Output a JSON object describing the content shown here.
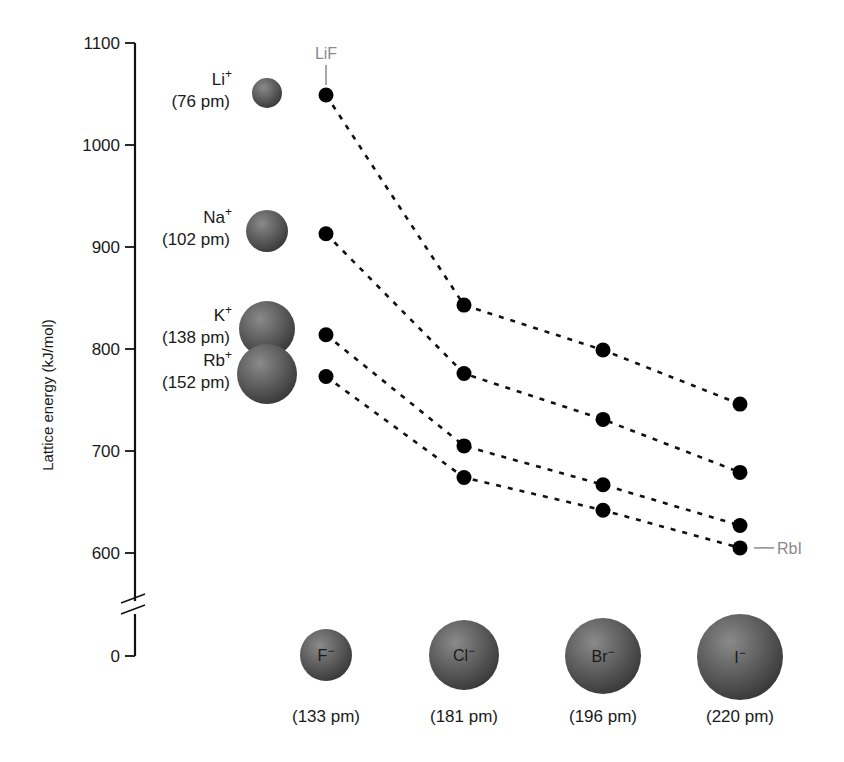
{
  "chart_data": {
    "type": "line",
    "title": "",
    "xlabel": "",
    "ylabel": "Lattice energy (kJ/mol)",
    "ylim": [
      0,
      1100
    ],
    "axis_break": true,
    "y_ticks": [
      0,
      600,
      700,
      800,
      900,
      1000,
      1100
    ],
    "grid": false,
    "legend": "none",
    "categories": [
      "F−",
      "Cl−",
      "Br−",
      "I−"
    ],
    "x_labels": [
      {
        "ion": "F",
        "charge": "−",
        "radius": "(133 pm)"
      },
      {
        "ion": "Cl",
        "charge": "−",
        "radius": "(181 pm)"
      },
      {
        "ion": "Br",
        "charge": "−",
        "radius": "(196 pm)"
      },
      {
        "ion": "I",
        "charge": "−",
        "radius": "(220 pm)"
      }
    ],
    "series": [
      {
        "name": "Li+",
        "ion": "Li",
        "charge": "+",
        "radius": "(76 pm)",
        "values": [
          1049,
          843,
          799,
          746
        ]
      },
      {
        "name": "Na+",
        "ion": "Na",
        "charge": "+",
        "radius": "(102 pm)",
        "values": [
          913,
          776,
          731,
          679
        ]
      },
      {
        "name": "K+",
        "ion": "K",
        "charge": "+",
        "radius": "(138 pm)",
        "values": [
          814,
          705,
          667,
          627
        ]
      },
      {
        "name": "Rb+",
        "ion": "Rb",
        "charge": "+",
        "radius": "(152 pm)",
        "values": [
          773,
          674,
          642,
          605
        ]
      }
    ],
    "annotations": [
      {
        "text": "LiF",
        "target": "Li+ / F−"
      },
      {
        "text": "RbI",
        "target": "Rb+ / I−"
      }
    ]
  }
}
